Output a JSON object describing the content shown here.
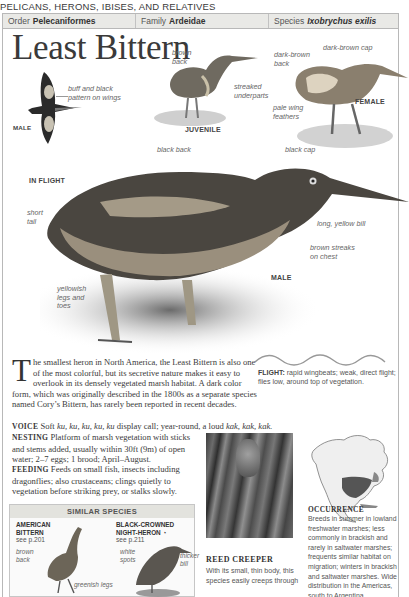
{
  "page": {
    "section_title": "PELICANS, HERONS, IBISES, AND RELATIVES"
  },
  "taxonomy": {
    "order_label": "Order",
    "order_value": "Pelecaniformes",
    "family_label": "Family",
    "family_value": "Ardeidae",
    "species_label": "Species",
    "species_value": "Ixobrychus exilis"
  },
  "title": "Least Bittern",
  "illustrations": {
    "flight": {
      "caption": "IN FLIGHT",
      "sex_label": "MALE",
      "annotations": [
        "buff and black",
        "pattern on wings"
      ]
    },
    "juvenile": {
      "caption": "JUVENILE",
      "annotations": {
        "back": [
          "brown",
          "back"
        ],
        "underparts": [
          "streaked",
          "underparts"
        ]
      }
    },
    "female": {
      "caption": "FEMALE",
      "annotations": {
        "back": [
          "dark-brown",
          "back"
        ],
        "cap": "dark-brown cap",
        "wing": [
          "pale wing",
          "feathers"
        ]
      }
    },
    "male": {
      "caption": "MALE",
      "annotations": {
        "back": "black back",
        "cap": "black cap",
        "tail": [
          "short",
          "tail"
        ],
        "bill": "long, yellow bill",
        "chest": [
          "brown streaks",
          "on chest"
        ],
        "legs": [
          "yellowish",
          "legs and",
          "toes"
        ]
      }
    }
  },
  "description": {
    "dropcap": "T",
    "intro": "he smallest heron in North America, the Least Bittern is also one of the most colorful, but its secretive nature makes it easy to overlook in its densely vegetated marsh habitat. A dark color form, which was originally described in the 1800s as a separate species named Cory’s Bittern, has rarely been reported in recent decades.",
    "voice_label": "VOICE",
    "voice_text_1": "Soft ",
    "voice_ku": "ku, ku, ku, ku, ku",
    "voice_text_2": " display call; year-round, a loud ",
    "voice_kak": "kak, kak, kak.",
    "nesting_label": "NESTING",
    "nesting_text": "Platform of marsh vegetation with sticks and stems added, usually within 30ft (9m) of open water; 2–7 eggs; 1 brood; April–August.",
    "feeding_label": "FEEDING",
    "feeding_text": "Feeds on small fish, insects including dragonflies; also crustaceans; clings quietly to vegetation before striking prey, or stalks slowly."
  },
  "flight": {
    "label": "FLIGHT:",
    "text": "rapid wingbeats; weak, direct flight; flies low, around top of vegetation."
  },
  "similar_species": {
    "heading": "SIMILAR SPECIES",
    "species": [
      {
        "name_line1": "AMERICAN",
        "name_line2": "BITTERN",
        "ref": "see p.201",
        "annotations": {
          "back": [
            "brown",
            "back"
          ],
          "legs": "greenish legs"
        }
      },
      {
        "name_line1": "BLACK-CROWNED",
        "name_line2": "NIGHT-HERON",
        "status_icon": "◔",
        "ref": "see p.211",
        "annotations": {
          "spots": [
            "white",
            "spots"
          ],
          "bill": [
            "thicker",
            "bill"
          ]
        }
      }
    ]
  },
  "photo": {
    "title": "REED CREEPER",
    "text": "With its small, thin body, this species easily creeps through"
  },
  "occurrence": {
    "title": "OCCURRENCE",
    "text": "Breeds in summer in lowland freshwater marshes; less commonly in brackish and rarely in saltwater marshes; frequents similar habitat on migration; winters in brackish and saltwater marshes. Wide distribution in the Americas, south to Argentina."
  }
}
